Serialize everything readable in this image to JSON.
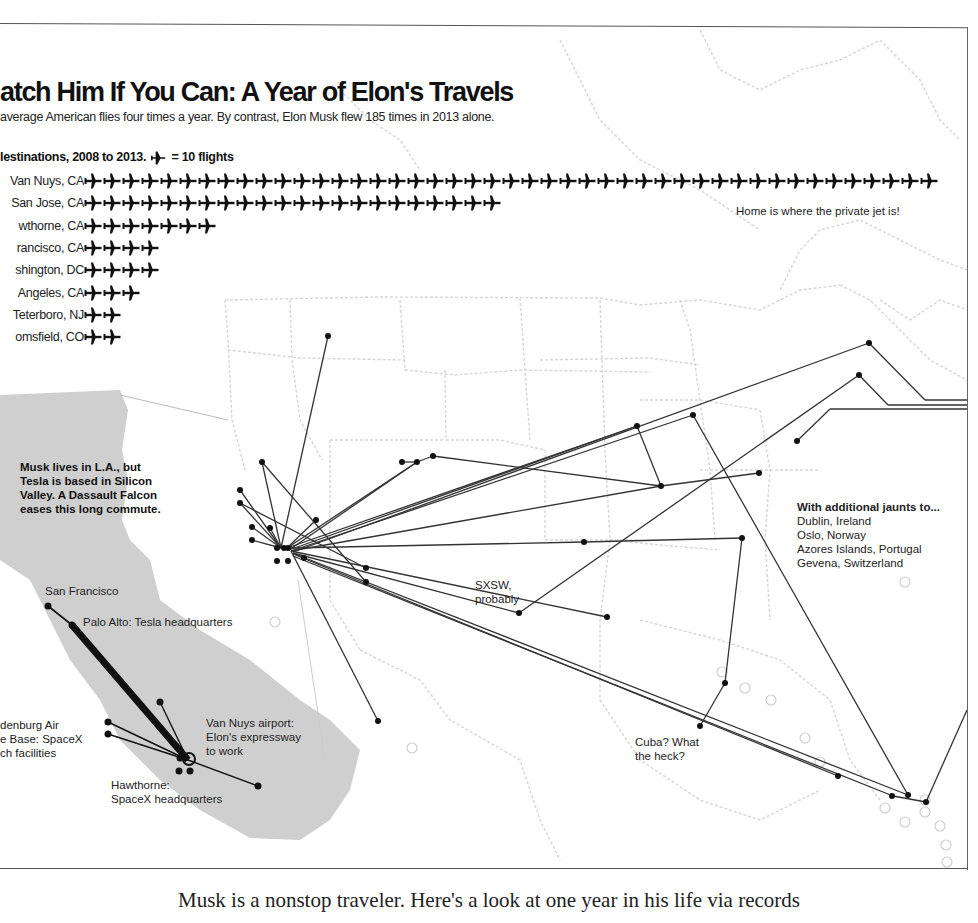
{
  "header": {
    "title": "atch Him If You Can: A Year of Elon's Travels",
    "subtitle": "average American flies four times a year. By contrast, Elon Musk flew 185 times in 2013 alone.",
    "legend_prefix": "lestinations, 2008 to 2013.",
    "legend_suffix": "= 10 flights"
  },
  "chart_data": [
    {
      "type": "bar",
      "subtype": "pictograph",
      "title": "Catch Him If You Can: A Year of Elon's Travels",
      "subtitle": "The average American flies four times a year. By contrast, Elon Musk flew 185 times in 2013 alone.",
      "legend": "Top destinations, 2008 to 2013. One plane icon = 10 flights",
      "unit": "flights",
      "icon_value": 10,
      "categories": [
        "Van Nuys, CA",
        "San Jose, CA",
        "Hawthorne, CA",
        "San Francisco, CA",
        "Washington, DC",
        "Los Angeles, CA",
        "Teterboro, NJ",
        "Broomfield, CO"
      ],
      "display_labels": [
        "Van Nuys, CA",
        "San Jose, CA",
        "wthorne, CA",
        "rancisco, CA",
        "shington, DC",
        "Angeles, CA",
        "Teterboro, NJ",
        "omsfield, CO"
      ],
      "icons": [
        45,
        22,
        7,
        4,
        4,
        3,
        2,
        2
      ],
      "values": [
        450,
        220,
        70,
        40,
        40,
        30,
        20,
        20
      ],
      "annotation": "Home is where the private jet is!"
    },
    {
      "type": "map",
      "title": "Flight routes from Los Angeles area, 2013",
      "origin": "Van Nuys airport",
      "annotations": [
        "Musk lives in L.A., but Tesla is based in Silicon Valley. A Dassault Falcon eases this long commute.",
        "SXSW, probably",
        "Cuba? What the heck?",
        "With additional jaunts to... Dublin, Ireland; Oslo, Norway; Azores Islands, Portugal; Gevena, Switzerland"
      ],
      "inset_labels": [
        "San Francisco",
        "Palo Alto: Tesla headquarters",
        "Vandenburg Air Force Base: SpaceX launch facilities",
        "Van Nuys airport: Elon's expressway to work",
        "Hawthorne: SpaceX headquarters"
      ]
    }
  ],
  "rows": [
    {
      "label": "Van Nuys, CA",
      "count": 45
    },
    {
      "label": "San Jose, CA",
      "count": 22
    },
    {
      "label": "wthorne, CA",
      "count": 7
    },
    {
      "label": "rancisco, CA",
      "count": 4
    },
    {
      "label": "shington, DC",
      "count": 4
    },
    {
      "label": "Angeles, CA",
      "count": 3
    },
    {
      "label": "Teterboro, NJ",
      "count": 2
    },
    {
      "label": "omsfield, CO",
      "count": 2
    }
  ],
  "notes": {
    "home": "Home is where the private jet is!",
    "commute": [
      "Musk lives in L.A., but",
      "Tesla is based in Silicon",
      "Valley. A Dassault Falcon",
      "eases this long commute."
    ],
    "sxsw": [
      "SXSW,",
      "probably"
    ],
    "cuba": [
      "Cuba? What",
      "the heck?"
    ],
    "jaunts_title": "With additional jaunts to...",
    "jaunts": [
      "Dublin, Ireland",
      "Oslo, Norway",
      "Azores Islands, Portugal",
      "Gevena, Switzerland"
    ]
  },
  "inset": {
    "sf": "San Francisco",
    "palo_alto": "Palo Alto: Tesla headquarters",
    "vandenburg": [
      "denburg Air",
      "e Base: SpaceX",
      "ch facilities"
    ],
    "van_nuys": [
      "Van Nuys airport:",
      "Elon's expressway",
      "to work"
    ],
    "hawthorne": [
      "Hawthorne:",
      "SpaceX headquarters"
    ]
  },
  "caption": "Musk is a nonstop traveler. Here's a look at one year in his life via records",
  "colors": {
    "ink": "#111111",
    "route": "#333333",
    "state_border": "#d4d4d4",
    "inset_fill": "#cfcfcf"
  }
}
